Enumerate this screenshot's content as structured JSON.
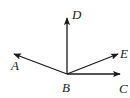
{
  "diagram": {
    "type": "rays-from-point",
    "origin": {
      "label": "B",
      "x": 67,
      "y": 74,
      "label_x": 62,
      "label_y": 92
    },
    "rays": [
      {
        "label": "D",
        "tip_x": 67,
        "tip_y": 17,
        "label_x": 72,
        "label_y": 19
      },
      {
        "label": "A",
        "tip_x": 13,
        "tip_y": 54,
        "label_x": 11,
        "label_y": 70
      },
      {
        "label": "E",
        "tip_x": 119,
        "tip_y": 53,
        "label_x": 120,
        "label_y": 58
      },
      {
        "label": "C",
        "tip_x": 121,
        "tip_y": 74,
        "label_x": 119,
        "label_y": 93
      }
    ],
    "stroke_color": "#1a1a1a"
  }
}
